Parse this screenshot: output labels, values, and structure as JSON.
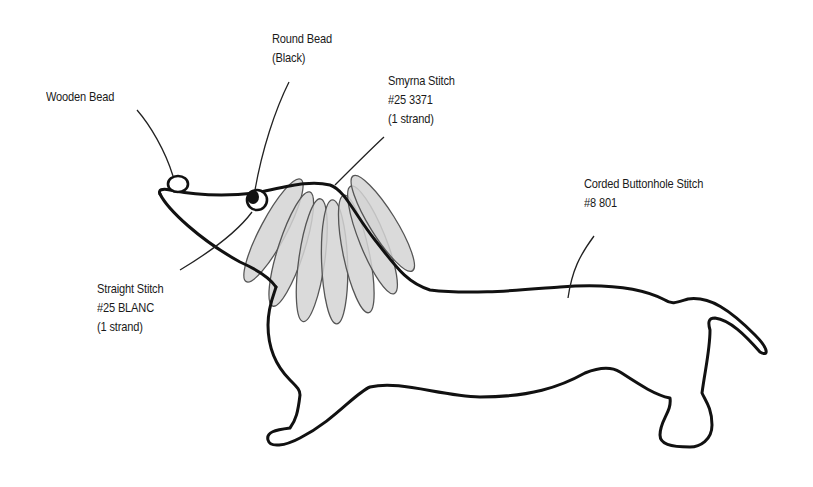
{
  "diagram": {
    "colors": {
      "outline": "#111111",
      "leaf_fill": "#d4d4d4",
      "leaf_stroke": "#555555",
      "background": "#ffffff",
      "text": "#1a1a1a"
    },
    "labels": {
      "wooden_bead": {
        "lines": [
          "Wooden Bead"
        ]
      },
      "round_bead": {
        "lines": [
          "Round Bead",
          "(Black)"
        ]
      },
      "smyrna_stitch": {
        "lines": [
          "Smyrna Stitch",
          "#25 3371",
          "(1 strand)"
        ]
      },
      "corded_buttonhole": {
        "lines": [
          "Corded Buttonhole Stitch",
          "#8 801"
        ]
      },
      "straight_stitch": {
        "lines": [
          "Straight Stitch",
          "#25 BLANC",
          "(1 strand)"
        ]
      }
    }
  }
}
